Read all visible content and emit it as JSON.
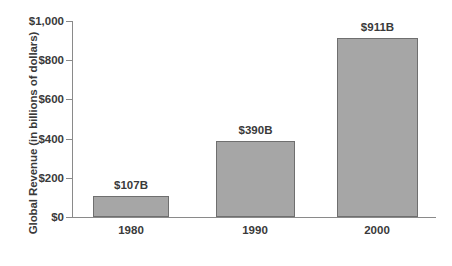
{
  "chart_data": {
    "type": "bar",
    "title": "",
    "xlabel": "",
    "ylabel": "Global Revenue (in billions of dollars)",
    "categories": [
      "1980",
      "1990",
      "2000"
    ],
    "values": [
      107,
      390,
      911
    ],
    "data_labels": [
      "$107B",
      "$390B",
      "$911B"
    ],
    "ylim": [
      0,
      1000
    ],
    "yticks": [
      0,
      200,
      400,
      600,
      800,
      1000
    ],
    "ytick_labels": [
      "$0",
      "$200",
      "$400",
      "$600",
      "$800",
      "$1,000"
    ],
    "grid": false,
    "legend": false,
    "series": [
      {
        "name": "Global Revenue",
        "values": [
          107,
          390,
          911
        ]
      }
    ],
    "colors": {
      "bar_fill": "#a6a6a6",
      "bar_border": "#6f6f6f",
      "axis": "#8a8a8a",
      "text": "#3a3a3a",
      "background": "#ffffff"
    }
  }
}
